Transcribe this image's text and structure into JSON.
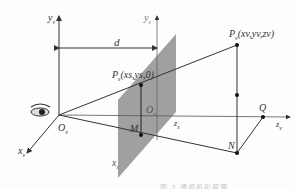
{
  "diagram": {
    "type": "perspective-projection",
    "labels": {
      "yv": "y",
      "yv_sub": "v",
      "ys": "y",
      "ys_sub": "s",
      "d": "d",
      "Pv": "P",
      "Pv_sub": "v",
      "Pv_coords": "(x",
      "Pv_coords_full": "(xv,yv,zv)",
      "Ps": "P",
      "Ps_sub": "s",
      "Ps_coords_full": "(xs,ys,0)",
      "Ov": "O",
      "Ov_sub": "v",
      "Os": "O",
      "Os_sub": "s",
      "M": "M",
      "N": "N",
      "Q": "Q",
      "xv": "x",
      "xv_sub": "v",
      "xs": "x",
      "xs_sub": "s",
      "zs": "z",
      "zs_sub": "s",
      "zv": "z",
      "zv_sub": "v"
    },
    "colors": {
      "line": "#333333",
      "plane": "#8f8f8f",
      "caption": "#c8c8c8"
    },
    "caption": "图 2  透视投影原理"
  }
}
